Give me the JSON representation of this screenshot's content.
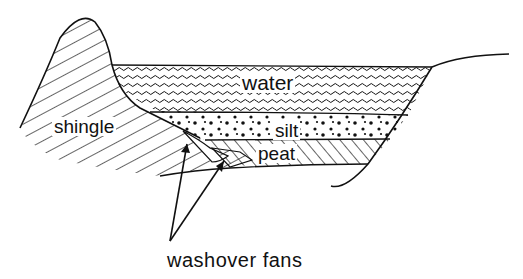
{
  "diagram": {
    "type": "geological cross-section",
    "layers": [
      {
        "id": "water",
        "label": "water",
        "pattern": "wavy-lines"
      },
      {
        "id": "silt",
        "label": "silt",
        "pattern": "dots"
      },
      {
        "id": "peat",
        "label": "peat",
        "pattern": "back-diagonal-hatch"
      },
      {
        "id": "shingle",
        "label": "shingle",
        "pattern": "forward-diagonal-hatch"
      }
    ],
    "annotation": {
      "label": "washover fans",
      "arrow_count": 2
    },
    "colors": {
      "ink": "#111111",
      "background": "#ffffff"
    }
  }
}
